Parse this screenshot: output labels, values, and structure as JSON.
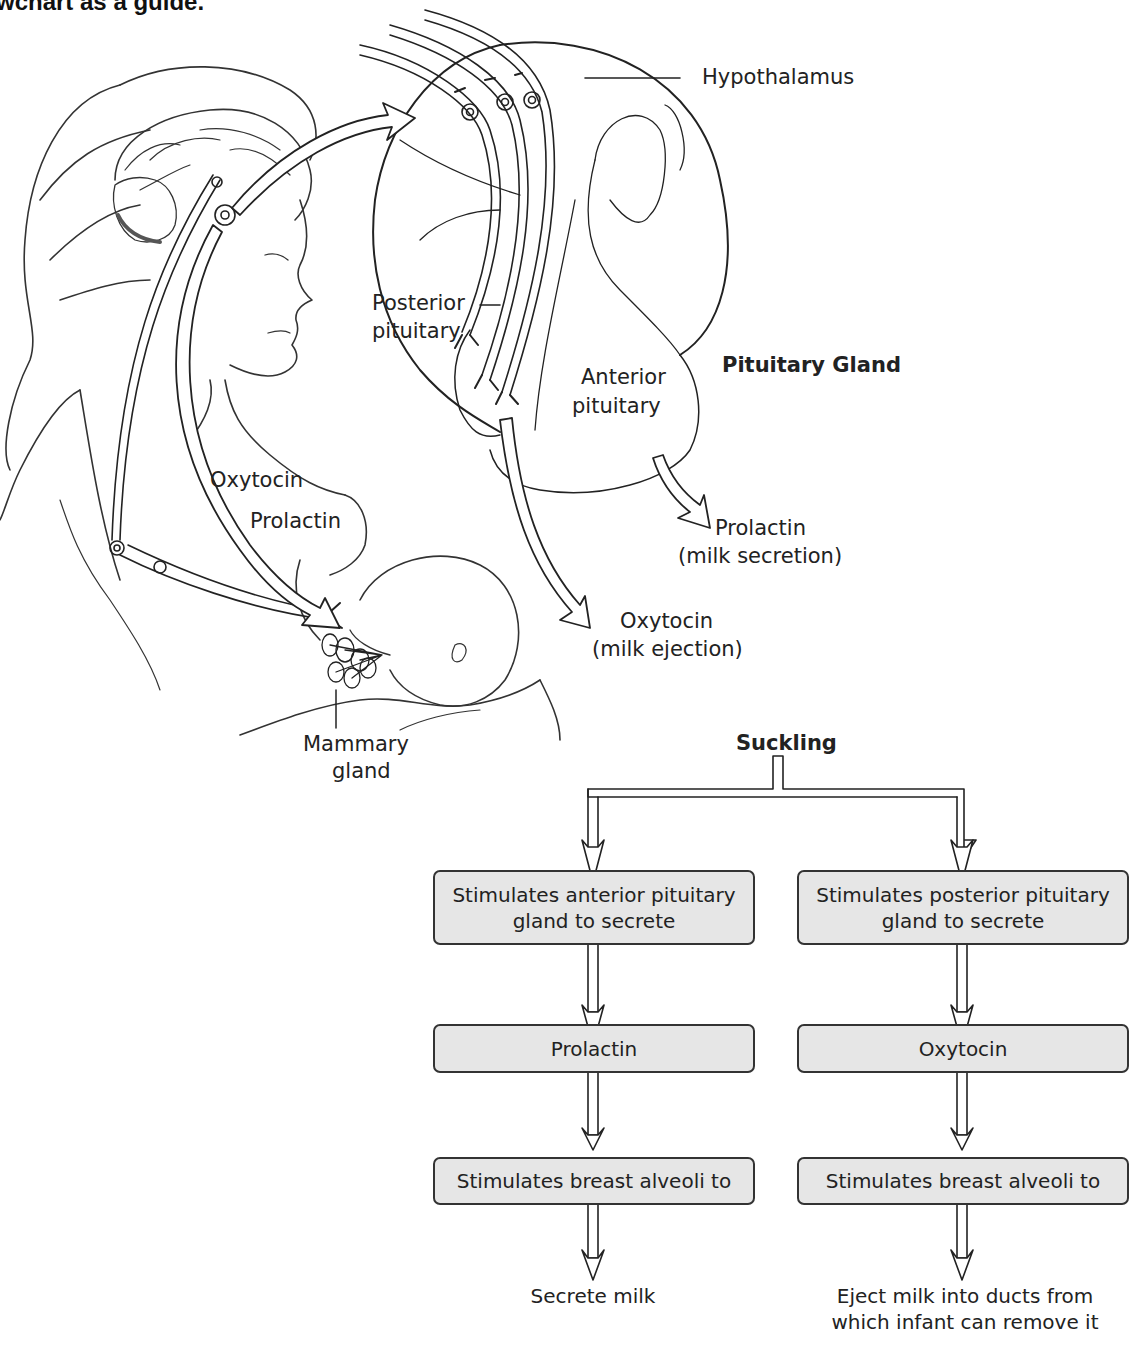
{
  "header": {
    "partial_text": "wchart as a guide."
  },
  "illustration": {
    "labels": {
      "hypothalamus": "Hypothalamus",
      "posterior_pituitary_line1": "Posterior",
      "posterior_pituitary_line2": "pituitary",
      "anterior_pituitary_line1": "Anterior",
      "anterior_pituitary_line2": "pituitary",
      "pituitary_gland": "Pituitary Gland",
      "prolactin_out_line1": "Prolactin",
      "prolactin_out_line2": "(milk secretion)",
      "oxytocin_out_line1": "Oxytocin",
      "oxytocin_out_line2": "(milk ejection)",
      "oxytocin_path": "Oxytocin",
      "prolactin_path": "Prolactin",
      "mammary_line1": "Mammary",
      "mammary_line2": "gland"
    }
  },
  "flowchart": {
    "root": "Suckling",
    "left": {
      "step1": "Stimulates anterior pituitary gland to secrete",
      "step1_line1": "Stimulates anterior pituitary",
      "step1_line2": "gland to secrete",
      "step2": "Prolactin",
      "step3": "Stimulates breast alveoli to",
      "outcome": "Secrete milk"
    },
    "right": {
      "step1": "Stimulates posterior pituitary gland to secrete",
      "step1_line1": "Stimulates posterior pituitary",
      "step1_line2": "gland to secrete",
      "step2": "Oxytocin",
      "step3": "Stimulates breast alveoli to",
      "outcome_line1": "Eject milk into ducts from",
      "outcome_line2": "which infant can remove it"
    }
  },
  "colors": {
    "box_fill": "#e6e6e6",
    "stroke": "#333333",
    "background": "#ffffff"
  }
}
